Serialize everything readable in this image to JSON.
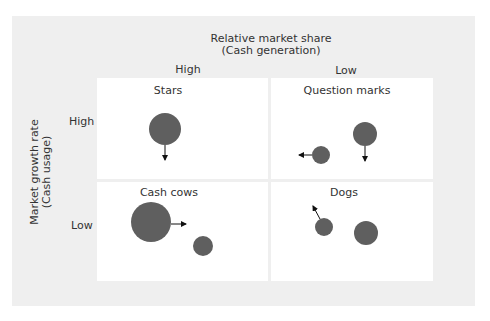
{
  "diagram": {
    "type": "BCG growth-share matrix",
    "x_axis": {
      "title_line1": "Relative market share",
      "title_line2": "(Cash generation)",
      "left_label": "High",
      "right_label": "Low"
    },
    "y_axis": {
      "title_line1": "Market growth rate",
      "title_line2": "(Cash usage)",
      "top_label": "High",
      "bottom_label": "Low"
    },
    "quadrants": [
      {
        "id": "stars",
        "title": "Stars"
      },
      {
        "id": "question-marks",
        "title": "Question marks"
      },
      {
        "id": "cash-cows",
        "title": "Cash cows"
      },
      {
        "id": "dogs",
        "title": "Dogs"
      }
    ],
    "bubble_color": "#5f5f5f",
    "arrow_color": "#111111",
    "panel_color": "#efefef",
    "quadrant_color": "#ffffff"
  }
}
